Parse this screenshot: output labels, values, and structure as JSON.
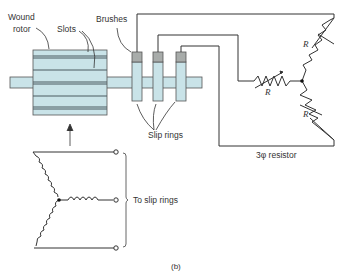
{
  "labels": {
    "wound_rotor_1": "Wound",
    "wound_rotor_2": "rotor",
    "slots": "Slots",
    "brushes": "Brushes",
    "slip_rings": "Slip rings",
    "resistor_r1": "R",
    "resistor_r2": "R",
    "resistor_r3": "R",
    "three_phase_resistor": "3φ resistor",
    "to_slip_rings": "To slip rings",
    "figure_label": "(b)"
  },
  "colors": {
    "rotor_fill": "#c9e3e8",
    "brush_fill": "#a8acaa",
    "line": "#333333"
  }
}
